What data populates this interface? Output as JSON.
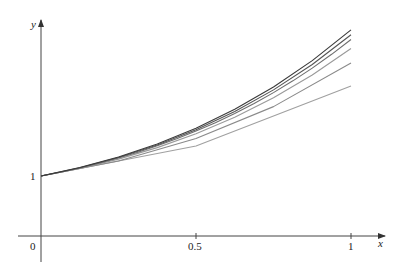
{
  "chart_data": {
    "type": "line",
    "title": "",
    "xlabel": "x",
    "ylabel": "y",
    "xlim": [
      0,
      1
    ],
    "ylim": [
      0,
      3.5
    ],
    "grid": false,
    "legend": "none",
    "x_ticks": [
      {
        "value": 0,
        "label": "0"
      },
      {
        "value": 0.5,
        "label": "0.5"
      },
      {
        "value": 1,
        "label": "1"
      }
    ],
    "y_ticks": [
      {
        "value": 1,
        "label": "1"
      }
    ],
    "series": [
      {
        "name": "Euler n=2",
        "color": "#a0a0a0",
        "x": [
          0,
          0.5,
          1
        ],
        "y": [
          1,
          1.5,
          2.5
        ]
      },
      {
        "name": "Euler n=4",
        "color": "#8a8a8a",
        "x": [
          0,
          0.25,
          0.5,
          0.75,
          1
        ],
        "y": [
          1,
          1.25,
          1.625,
          2.15625,
          2.88281
        ]
      },
      {
        "name": "Euler n=8",
        "color": "#9a9a9a",
        "x": [
          0,
          0.125,
          0.25,
          0.375,
          0.5,
          0.625,
          0.75,
          0.875,
          1
        ],
        "y": [
          1,
          1.125,
          1.28125,
          1.47266,
          1.70361,
          1.97906,
          2.30393,
          2.6838,
          3.12427
        ]
      },
      {
        "name": "Euler n=16",
        "color": "#6e6e6e",
        "x": [
          0,
          0.0625,
          0.125,
          0.1875,
          0.25,
          0.3125,
          0.375,
          0.4375,
          0.5,
          0.5625,
          0.625,
          0.6875,
          0.75,
          0.8125,
          0.875,
          0.9375,
          1
        ],
        "y": [
          1,
          1.0625,
          1.13281,
          1.21143,
          1.29886,
          1.39567,
          1.50243,
          1.61977,
          1.74835,
          1.88887,
          2.04208,
          2.20877,
          2.38979,
          2.58603,
          2.79844,
          3.02803,
          3.27587
        ]
      },
      {
        "name": "Euler n=32",
        "color": "#555555",
        "x": [
          0,
          0.125,
          0.25,
          0.375,
          0.5,
          0.625,
          0.75,
          0.875,
          1
        ],
        "y": [
          1,
          1.13696,
          1.30824,
          1.51832,
          1.77228,
          2.07588,
          2.43562,
          2.85886,
          3.35398
        ]
      },
      {
        "name": "Exact",
        "color": "#3a3a3a",
        "x": [
          0,
          0.125,
          0.25,
          0.375,
          0.5,
          0.625,
          0.75,
          0.875,
          1
        ],
        "y": [
          1,
          1.1413,
          1.31805,
          1.53498,
          1.79744,
          2.1115,
          2.484,
          2.92275,
          3.43656
        ]
      }
    ]
  },
  "axes": {
    "x_label": "x",
    "y_label": "y",
    "origin_label": "0",
    "x_tick_half": "0.5",
    "x_tick_one": "1",
    "y_tick_one": "1"
  }
}
